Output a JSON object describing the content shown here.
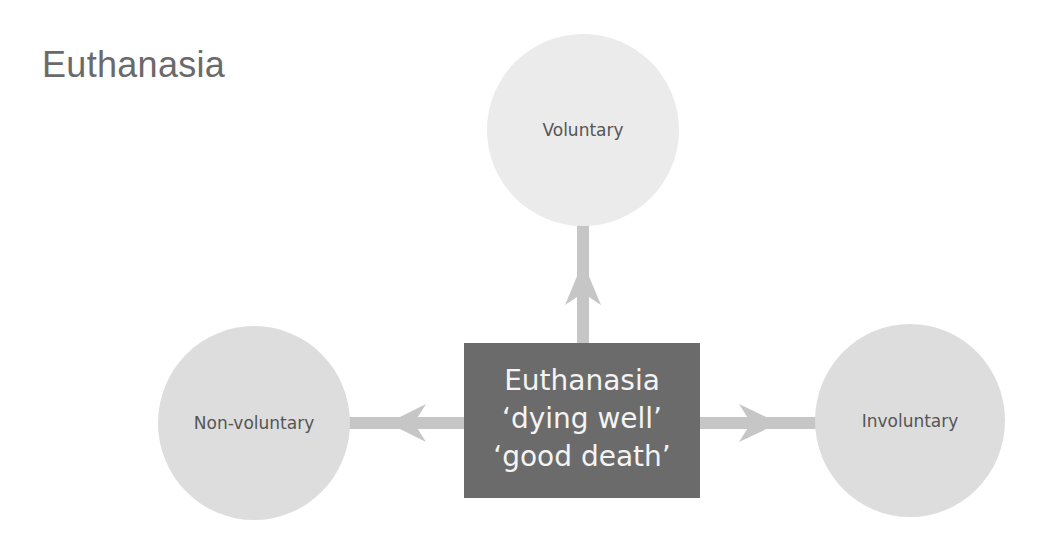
{
  "title": "Euthanasia",
  "colors": {
    "title": "#6a6a6a",
    "center_box": "#6b6b6b",
    "center_text": "#f4f4f4",
    "top_node": "#ebebeb",
    "side_node": "#dddddd",
    "arrow": "#c6c6c6",
    "node_text": "#555555"
  },
  "center": {
    "lines": [
      "Euthanasia",
      "‘dying well’",
      "‘good death’"
    ]
  },
  "nodes": [
    {
      "id": "voluntary",
      "label": "Voluntary",
      "position": "top"
    },
    {
      "id": "non-voluntary",
      "label": "Non-voluntary",
      "position": "left"
    },
    {
      "id": "involuntary",
      "label": "Involuntary",
      "position": "right"
    }
  ],
  "arrows": [
    {
      "from": "center",
      "to": "voluntary",
      "direction": "up"
    },
    {
      "from": "center",
      "to": "non-voluntary",
      "direction": "left"
    },
    {
      "from": "center",
      "to": "involuntary",
      "direction": "right"
    }
  ]
}
